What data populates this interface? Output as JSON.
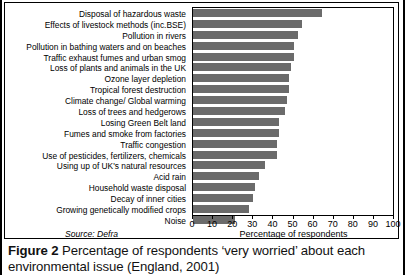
{
  "figure": {
    "caption_label": "Figure 2",
    "caption_text": " Percentage of respondents ‘very worried’ about each environmental issue (England, 2001)",
    "source": "Source: Defra"
  },
  "chart_data": {
    "type": "bar",
    "orientation": "horizontal",
    "title": "",
    "xlabel": "Percentage of respondents",
    "ylabel": "",
    "xlim": [
      0,
      100
    ],
    "ylim": null,
    "grid": false,
    "legend": null,
    "bar_color": "#6b6b6b",
    "xticks": [
      0,
      10,
      20,
      30,
      40,
      50,
      60,
      70,
      80,
      90,
      100
    ],
    "categories": [
      "Disposal of hazardous waste",
      "Effects of livestock methods (inc.BSE)",
      "Pollution in rivers",
      "Pollution in bathing waters and on beaches",
      "Traffic exhaust fumes and urban smog",
      "Loss of plants and animals in the UK",
      "Ozone layer depletion",
      "Tropical forest destruction",
      "Climate change/ Global warming",
      "Loss of trees and hedgerows",
      "Losing Green Belt land",
      "Fumes and smoke from factories",
      "Traffic congestion",
      "Use of pesticides, fertilizers, chemicals",
      "Using up of UK's natural resources",
      "Acid rain",
      "Household waste disposal",
      "Decay of inner cities",
      "Growing genetically modified crops",
      "Noise"
    ],
    "values": [
      64,
      54,
      52,
      50,
      50,
      49,
      48,
      48,
      47,
      46,
      43,
      43,
      42,
      42,
      36,
      33,
      31,
      30,
      28,
      21
    ]
  }
}
